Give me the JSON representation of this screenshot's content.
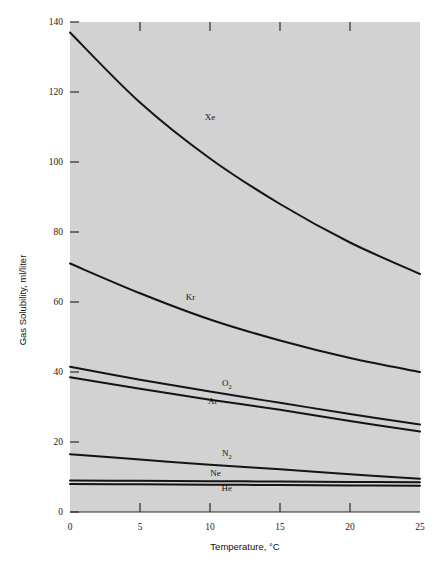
{
  "figure": {
    "background_color": "#ffffff",
    "plot_background_color": "#d2d2d2",
    "curve_color": "#141414",
    "axis_color": "#2b2b2b"
  },
  "chart_data": {
    "type": "line",
    "title": "",
    "xlabel": "Temperature, °C",
    "ylabel": "Gas Solubility, ml/liter",
    "xlim": [
      0,
      25
    ],
    "ylim": [
      0,
      140
    ],
    "xticks": [
      0,
      5,
      10,
      15,
      20,
      25
    ],
    "xtick_labels": [
      "0",
      "5",
      "10",
      "15",
      "20",
      "25"
    ],
    "yticks": [
      0,
      20,
      40,
      60,
      80,
      100,
      120,
      140
    ],
    "ytick_labels": [
      "0",
      "20",
      "40",
      "60",
      "80",
      "100",
      "120",
      "140"
    ],
    "grid": false,
    "legend_position": "inline-curve-labels",
    "x": [
      0,
      5,
      10,
      15,
      20,
      25
    ],
    "series": [
      {
        "name": "Xe",
        "label": "Xe",
        "label_sub": "",
        "label_x": 10.0,
        "label_y": 112.0,
        "values": [
          137.0,
          117.0,
          101.0,
          88.0,
          77.0,
          68.0
        ]
      },
      {
        "name": "Kr",
        "label": "Kr",
        "label_sub": "",
        "label_x": 8.6,
        "label_y": 60.5,
        "values": [
          71.0,
          62.5,
          55.0,
          49.0,
          44.0,
          40.0
        ]
      },
      {
        "name": "O2",
        "label": "O",
        "label_sub": "2",
        "label_x": 11.2,
        "label_y": 36.0,
        "values": [
          41.5,
          37.8,
          34.4,
          31.2,
          28.0,
          25.0
        ]
      },
      {
        "name": "Ar",
        "label": "Ar",
        "label_sub": "",
        "label_x": 10.2,
        "label_y": 31.0,
        "values": [
          38.5,
          35.2,
          32.1,
          29.2,
          26.0,
          23.0
        ]
      },
      {
        "name": "N2",
        "label": "N",
        "label_sub": "2",
        "label_x": 11.2,
        "label_y": 16.0,
        "values": [
          16.5,
          15.0,
          13.5,
          12.2,
          10.8,
          9.5
        ]
      },
      {
        "name": "Ne",
        "label": "Ne",
        "label_sub": "",
        "label_x": 10.4,
        "label_y": 10.2,
        "values": [
          9.0,
          8.9,
          8.8,
          8.7,
          8.6,
          8.5
        ]
      },
      {
        "name": "He",
        "label": "He",
        "label_sub": "",
        "label_x": 11.2,
        "label_y": 6.0,
        "values": [
          8.0,
          7.9,
          7.8,
          7.7,
          7.6,
          7.5
        ]
      }
    ]
  }
}
